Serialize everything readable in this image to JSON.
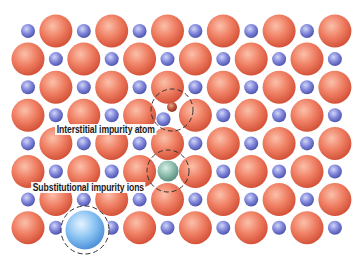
{
  "diagram": {
    "type": "crystal-lattice-impurities",
    "lattice": {
      "rows": 8,
      "cols": 12,
      "origin_x": 28,
      "origin_y": 31,
      "spacing_x": 27.9,
      "spacing_y": 28.1,
      "large_radius": 16.5,
      "small_radius": 7
    },
    "colors": {
      "large_ion": {
        "light": "#fbc0aa",
        "mid": "#ef7e62",
        "dark": "#d4533a"
      },
      "small_ion": {
        "light": "#d2d6f7",
        "mid": "#8087da",
        "dark": "#4f55ad"
      },
      "interstitial_atom": {
        "light": "#e8a58a",
        "mid": "#c0583c",
        "dark": "#8d3422"
      },
      "substitutional_small": {
        "light": "#d7efe6",
        "mid": "#8fbfae",
        "dark": "#5b8f7e"
      },
      "substitutional_large": {
        "light": "#e6f3ff",
        "mid": "#8cc4f3",
        "dark": "#4e92d8"
      },
      "dashed_circle": "#333333"
    },
    "impurities": [
      {
        "kind": "interstitial",
        "x": 172,
        "y": 107,
        "r": 5,
        "circle": {
          "x": 172,
          "y": 110,
          "r": 21
        },
        "shift_neighbor": {
          "row": 3,
          "col": 5,
          "dx": -4,
          "dy": 4
        }
      },
      {
        "kind": "substitutional-small",
        "row": 5,
        "col": 5,
        "x": 168,
        "y": 171,
        "r": 10.5,
        "circle": {
          "x": 168,
          "y": 171,
          "r": 21
        }
      },
      {
        "kind": "substitutional-large",
        "row": 7,
        "col": 2,
        "x": 85,
        "y": 230,
        "r": 19.5,
        "circle": {
          "x": 85,
          "y": 230,
          "r": 24
        }
      }
    ],
    "labels": [
      {
        "id": "interstitial",
        "text": "Interstitial impurity atom",
        "x": 55,
        "y": 124
      },
      {
        "id": "substitutional",
        "text": "Substitutional impurity ions",
        "x": 31,
        "y": 182
      }
    ]
  }
}
